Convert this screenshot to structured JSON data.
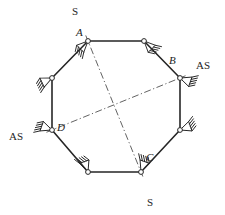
{
  "figure": {
    "stroke_color": "#262626",
    "dash_color": "#3a3a3a",
    "node_fill": "#ffffff",
    "background": "#ffffff",
    "member_width": 1.6,
    "hatch_width": 0.9,
    "node_radius": 2.4,
    "vertices": [
      {
        "id": "A",
        "label": "A",
        "x": 88,
        "y": 41,
        "label_dx": -12,
        "label_dy": -5,
        "labeled": true
      },
      {
        "id": "T2",
        "label": "",
        "x": 144,
        "y": 41,
        "label_dx": 0,
        "label_dy": 0,
        "labeled": false
      },
      {
        "id": "B",
        "label": "B",
        "x": 180,
        "y": 78,
        "label_dx": -11,
        "label_dy": -14,
        "labeled": true
      },
      {
        "id": "R2",
        "label": "",
        "x": 180,
        "y": 130,
        "label_dx": 0,
        "label_dy": 0,
        "labeled": false
      },
      {
        "id": "C",
        "label": "C",
        "x": 141,
        "y": 172,
        "label_dx": 5,
        "label_dy": -11,
        "labeled": true
      },
      {
        "id": "B2",
        "label": "",
        "x": 88,
        "y": 172,
        "label_dx": 0,
        "label_dy": 0,
        "labeled": false
      },
      {
        "id": "D",
        "label": "D",
        "x": 52,
        "y": 130,
        "label_dx": 5,
        "label_dy": 1,
        "labeled": true
      },
      {
        "id": "L2",
        "label": "",
        "x": 52,
        "y": 78,
        "label_dx": 0,
        "label_dy": 0,
        "labeled": false
      }
    ],
    "members": [
      {
        "from": "A",
        "to": "T2"
      },
      {
        "from": "T2",
        "to": "B"
      },
      {
        "from": "B",
        "to": "R2"
      },
      {
        "from": "R2",
        "to": "C"
      },
      {
        "from": "C",
        "to": "B2"
      },
      {
        "from": "B2",
        "to": "D"
      },
      {
        "from": "D",
        "to": "L2"
      },
      {
        "from": "L2",
        "to": "A"
      }
    ],
    "axes": [
      {
        "name": "axis-a-c",
        "from": "A",
        "to": "C"
      },
      {
        "name": "axis-d-b",
        "from": "D",
        "to": "B"
      }
    ],
    "supports": [
      {
        "at": "A",
        "name": "support-a",
        "angle": 135,
        "label": "S",
        "label_x": 72,
        "label_y": 6
      },
      {
        "at": "T2",
        "name": "support-top-right",
        "angle": 45,
        "label": "",
        "label_x": 0,
        "label_y": 0
      },
      {
        "at": "B",
        "name": "support-b",
        "angle": 20,
        "label": "AS",
        "label_x": 196,
        "label_y": 60
      },
      {
        "at": "R2",
        "name": "support-lower-right",
        "angle": 340,
        "label": "",
        "label_x": 0,
        "label_y": 0
      },
      {
        "at": "C",
        "name": "support-c",
        "angle": 290,
        "label": "S",
        "label_x": 147,
        "label_y": 197
      },
      {
        "at": "B2",
        "name": "support-bottom-left",
        "angle": 250,
        "label": "",
        "label_x": 0,
        "label_y": 0
      },
      {
        "at": "D",
        "name": "support-d",
        "angle": 200,
        "label": "AS",
        "label_x": 9,
        "label_y": 131
      },
      {
        "at": "L2",
        "name": "support-upper-left",
        "angle": 155,
        "label": "",
        "label_x": 0,
        "label_y": 0
      }
    ],
    "legend_keys": [
      {
        "key": "S",
        "meaning": "S"
      },
      {
        "key": "AS",
        "meaning": "AS"
      }
    ]
  }
}
